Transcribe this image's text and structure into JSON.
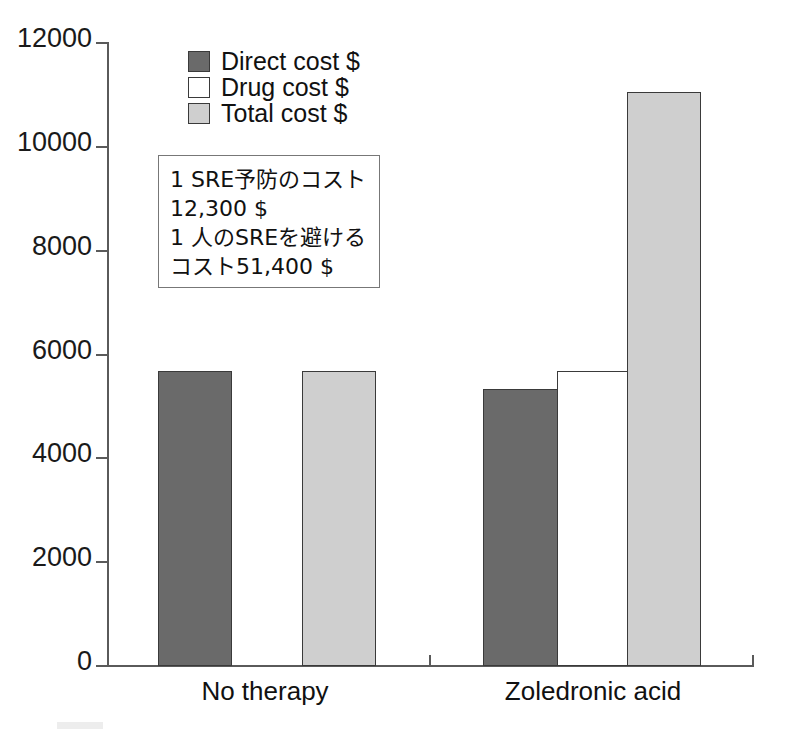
{
  "chart_data": {
    "type": "bar",
    "title": "",
    "xlabel": "",
    "ylabel": "",
    "ylim": [
      0,
      12000
    ],
    "yticks": [
      0,
      2000,
      4000,
      6000,
      8000,
      10000,
      12000
    ],
    "ytick_labels": [
      "0",
      "2000",
      "4000",
      "6000",
      "8000",
      "10000",
      "12000"
    ],
    "grid": false,
    "legend_position": "top-center",
    "categories": [
      "No therapy",
      "Zoledronic acid"
    ],
    "series": [
      {
        "name": "Direct cost $",
        "color": "#6a6a6a",
        "values": [
          5700,
          5350
        ]
      },
      {
        "name": "Drug cost $",
        "color": "#ffffff",
        "values": [
          null,
          5700
        ]
      },
      {
        "name": "Total cost $",
        "color": "#cfcfcf",
        "values": [
          5700,
          11040
        ]
      }
    ],
    "annotations": [
      "1 SRE予防のコスト",
      "12,300 $",
      "1 人のSREを避ける",
      "コスト51,400 $"
    ]
  },
  "legend": {
    "items": [
      {
        "label": "Direct cost $",
        "swatch": "direct"
      },
      {
        "label": "Drug cost $",
        "swatch": "drug"
      },
      {
        "label": "Total cost $",
        "swatch": "total"
      }
    ]
  },
  "axes": {
    "y_ticks": [
      {
        "label": "12000",
        "value": 12000
      },
      {
        "label": "10000",
        "value": 10000
      },
      {
        "label": "8000",
        "value": 8000
      },
      {
        "label": "6000",
        "value": 6000
      },
      {
        "label": "4000",
        "value": 4000
      },
      {
        "label": "2000",
        "value": 2000
      },
      {
        "label": "0",
        "value": 0
      }
    ],
    "x_labels": [
      "No therapy",
      "Zoledronic acid"
    ]
  },
  "annotation_box": {
    "lines": [
      "1 SRE予防のコスト",
      "12,300 $",
      "1 人のSREを避ける",
      "コスト51,400 $"
    ]
  },
  "colors": {
    "direct": "#6a6a6a",
    "drug": "#ffffff",
    "total": "#cfcfcf",
    "axis": "#5a5a5a",
    "outline": "#3a3a3a"
  }
}
